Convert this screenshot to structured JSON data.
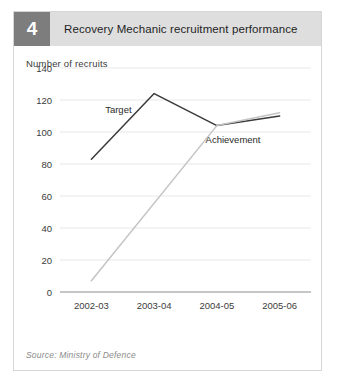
{
  "figure": {
    "number": "4",
    "title": "Recovery Mechanic recruitment performance",
    "source": "Source: Ministry of Defence"
  },
  "colors": {
    "number_box": "#7d7d7d",
    "header_band": "#dedede",
    "target_line": "#3a3a3a",
    "achievement_line": "#c4c4c4",
    "gridline": "#e8e8e8",
    "axis": "#8d8d8d",
    "frame": "#d6d6d6"
  },
  "chart_data": {
    "type": "line",
    "title": "Recovery Mechanic recruitment performance",
    "xlabel": "",
    "ylabel": "Number of recruits",
    "categories": [
      "2002-03",
      "2003-04",
      "2004-05",
      "2005-06"
    ],
    "ylim": [
      0,
      140
    ],
    "yticks": [
      0,
      20,
      40,
      60,
      80,
      100,
      120,
      140
    ],
    "ytick_labels": [
      "0",
      "20",
      "40",
      "60",
      "80",
      "100",
      "120",
      "140"
    ],
    "grid": true,
    "legend": "inline-annotations",
    "series": [
      {
        "name": "Target",
        "color": "#3a3a3a",
        "values": [
          83,
          124,
          104,
          110
        ]
      },
      {
        "name": "Achievement",
        "color": "#c4c4c4",
        "values": [
          7,
          null,
          104,
          112
        ]
      }
    ],
    "annotations": [
      {
        "text": "Target",
        "x_frac": 0.18,
        "y_value": 112
      },
      {
        "text": "Achievement",
        "x_frac": 0.58,
        "y_value": 93
      }
    ]
  }
}
